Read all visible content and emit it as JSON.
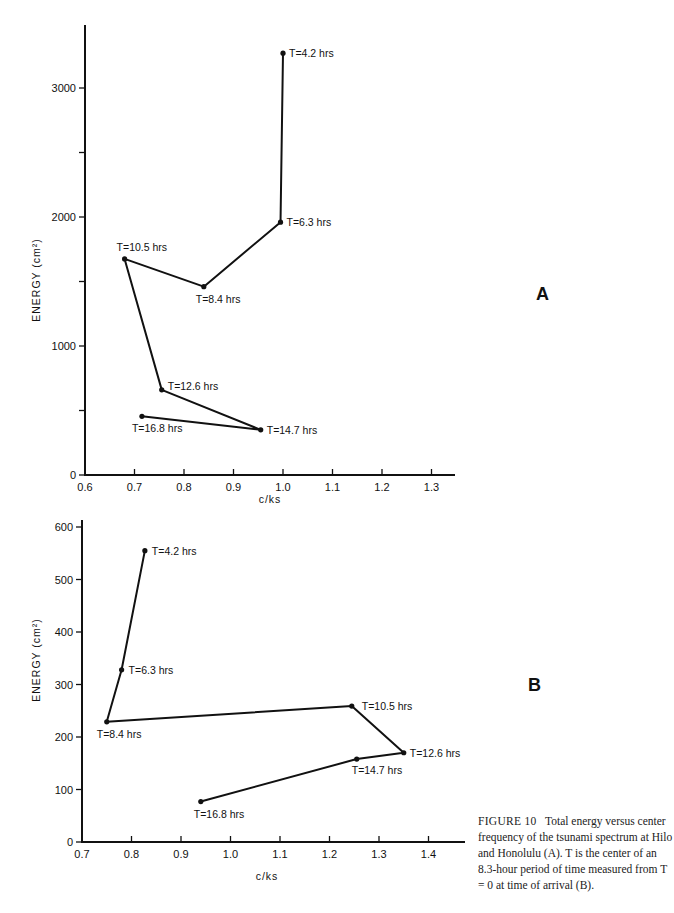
{
  "caption": {
    "figure_label": "FIGURE 10",
    "text": "Total energy versus center frequency of the tsunami spectrum at Hilo and Honolulu (A). T is the center of an 8.3-hour period of time measured from T = 0 at time of arrival (B)."
  },
  "chart_data": [
    {
      "type": "line",
      "panel": "A",
      "title": "",
      "xlabel": "c/ks",
      "ylabel": "ENERGY (cm²)",
      "xlim": [
        0.6,
        1.35
      ],
      "ylim": [
        0,
        3500
      ],
      "xticks": [
        0.6,
        0.7,
        0.8,
        0.9,
        1.0,
        1.1,
        1.2,
        1.3
      ],
      "xtick_labels": [
        "0.6",
        "0.7",
        "0.8",
        "0.9",
        "1.0",
        "1.1",
        "1.2",
        "1.3"
      ],
      "yticks": [
        0,
        500,
        1000,
        1500,
        2000,
        2500,
        3000
      ],
      "ytick_labels": [
        "0",
        "",
        "1000",
        "",
        "2000",
        "",
        "3000"
      ],
      "grid": false,
      "series": [
        {
          "name": "Energy trajectory",
          "points": [
            {
              "label": "T=4.2 hrs",
              "x": 1.0,
              "y": 3270
            },
            {
              "label": "T=6.3 hrs",
              "x": 0.995,
              "y": 1960
            },
            {
              "label": "T=8.4 hrs",
              "x": 0.84,
              "y": 1460
            },
            {
              "label": "T=10.5 hrs",
              "x": 0.68,
              "y": 1675
            },
            {
              "label": "T=12.6 hrs",
              "x": 0.755,
              "y": 660
            },
            {
              "label": "T=14.7 hrs",
              "x": 0.955,
              "y": 350
            },
            {
              "label": "T=16.8 hrs",
              "x": 0.715,
              "y": 455
            }
          ]
        }
      ]
    },
    {
      "type": "line",
      "panel": "B",
      "title": "",
      "xlabel": "c/ks",
      "ylabel": "ENERGY (cm²)",
      "xlim": [
        0.7,
        1.47
      ],
      "ylim": [
        0,
        600
      ],
      "xticks": [
        0.7,
        0.8,
        0.9,
        1.0,
        1.1,
        1.2,
        1.3,
        1.4
      ],
      "xtick_labels": [
        "0.7",
        "0.8",
        "0.9",
        "1.0",
        "1.1",
        "1.2",
        "1.3",
        "1.4"
      ],
      "yticks": [
        0,
        100,
        200,
        300,
        400,
        500,
        600
      ],
      "ytick_labels": [
        "0",
        "100",
        "200",
        "300",
        "400",
        "500",
        "600"
      ],
      "grid": false,
      "series": [
        {
          "name": "Energy trajectory",
          "points": [
            {
              "label": "T=4.2 hrs",
              "x": 0.827,
              "y": 555
            },
            {
              "label": "T=6.3 hrs",
              "x": 0.78,
              "y": 328
            },
            {
              "label": "T=8.4 hrs",
              "x": 0.75,
              "y": 229
            },
            {
              "label": "T=10.5 hrs",
              "x": 1.245,
              "y": 259
            },
            {
              "label": "T=12.6 hrs",
              "x": 1.35,
              "y": 170
            },
            {
              "label": "T=14.7 hrs",
              "x": 1.255,
              "y": 158
            },
            {
              "label": "T=16.8 hrs",
              "x": 0.94,
              "y": 77
            }
          ]
        }
      ]
    }
  ]
}
